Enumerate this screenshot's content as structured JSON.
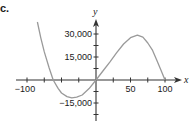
{
  "figure": {
    "part_label": "c."
  },
  "chart_data": {
    "type": "line",
    "title": "",
    "xlabel": "x",
    "ylabel": "y",
    "xlim": [
      -110,
      125
    ],
    "ylim": [
      -28000,
      46000
    ],
    "grid": false,
    "legend": null,
    "x_ticks": [
      -100,
      -75,
      -50,
      -25,
      0,
      25,
      50,
      75,
      100
    ],
    "x_tick_labels": [
      {
        "value": -100,
        "label": "−100"
      },
      {
        "value": 50,
        "label": "50"
      },
      {
        "value": 100,
        "label": "100"
      }
    ],
    "y_ticks": [
      30000,
      22500,
      15000,
      7500,
      -7500,
      -15000,
      -22500
    ],
    "y_tick_labels": [
      {
        "value": 30000,
        "label": "30,000"
      },
      {
        "value": 15000,
        "label": "15,000"
      },
      {
        "value": -15000,
        "label": "−15,000"
      }
    ],
    "series": [
      {
        "name": "curve",
        "color": "#9a9a9a",
        "x": [
          -85,
          -80,
          -75,
          -68,
          -62,
          -55,
          -50,
          -42,
          -35,
          -28,
          -20,
          -10,
          0,
          10,
          20,
          30,
          40,
          50,
          60,
          68,
          75,
          82,
          88,
          94,
          100
        ],
        "y": [
          37800,
          27500,
          18300,
          8000,
          0,
          -5500,
          -8500,
          -10800,
          -11700,
          -11200,
          -9800,
          -5600,
          0,
          5900,
          11700,
          17800,
          23500,
          27600,
          29300,
          27900,
          24100,
          19300,
          13000,
          6600,
          0
        ]
      }
    ],
    "annotations": []
  },
  "style": {
    "axis_color": "#333333",
    "curve_color": "#9a9a9a",
    "text_color": "#1a1a1a"
  }
}
